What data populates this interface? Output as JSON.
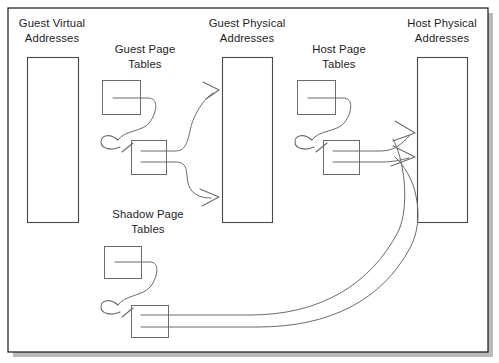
{
  "figure": {
    "type": "diagram",
    "topic": "memory-address-translation-virtualization",
    "background_color": "#ffffff",
    "frame_color": "#1a1a1a",
    "box_stroke_color": "#4a4a4a",
    "connector_color": "#6b6b6b"
  },
  "labels": {
    "guest_virtual": {
      "line1": "Guest Virtual",
      "line2": "Addresses"
    },
    "guest_page_tables": {
      "line1": "Guest Page",
      "line2": "Tables"
    },
    "guest_physical": {
      "line1": "Guest Physical",
      "line2": "Addresses"
    },
    "host_page_tables": {
      "line1": "Host Page",
      "line2": "Tables"
    },
    "host_physical": {
      "line1": "Host Physical",
      "line2": "Addresses"
    },
    "shadow_page_tables": {
      "line1": "Shadow Page",
      "line2": "Tables"
    }
  },
  "columns": [
    {
      "id": "guest-virtual-addresses",
      "kind": "address-space",
      "label_key": "guest_virtual"
    },
    {
      "id": "guest-page-tables",
      "kind": "page-table-group",
      "label_key": "guest_page_tables"
    },
    {
      "id": "guest-physical-addresses",
      "kind": "address-space",
      "label_key": "guest_physical"
    },
    {
      "id": "host-page-tables",
      "kind": "page-table-group",
      "label_key": "host_page_tables"
    },
    {
      "id": "host-physical-addresses",
      "kind": "address-space",
      "label_key": "host_physical"
    },
    {
      "id": "shadow-page-tables",
      "kind": "page-table-group",
      "label_key": "shadow_page_tables"
    }
  ],
  "flows": [
    {
      "from": "guest-page-tables",
      "to": "guest-physical-addresses",
      "count": 2
    },
    {
      "from": "host-page-tables",
      "to": "host-physical-addresses",
      "count": 2
    },
    {
      "from": "shadow-page-tables",
      "to": "host-physical-addresses",
      "count": 2
    }
  ]
}
